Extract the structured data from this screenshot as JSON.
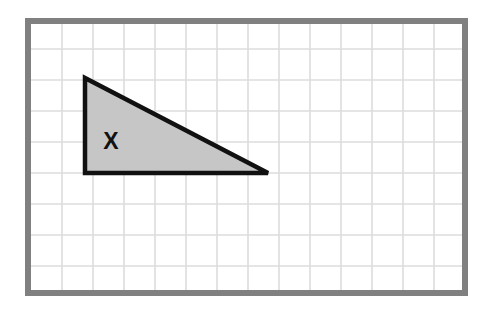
{
  "figure": {
    "kind": "geometry-diagram",
    "canvas": {
      "width": 494,
      "height": 318,
      "background_color": "#ffffff"
    },
    "frame": {
      "name": "grid-frame",
      "x": 25,
      "y": 18,
      "width": 443,
      "height": 278,
      "border_color": "#808080",
      "border_width": 6,
      "fill_color": "#ffffff"
    },
    "grid": {
      "name": "square-grid",
      "line_color": "#dcdcdc",
      "line_width": 1.6,
      "cell_size": 31,
      "origin_x": 31,
      "origin_y": 24,
      "columns": 14,
      "rows": 9,
      "vertical_lines": [
        62,
        93,
        124,
        155,
        186,
        217,
        248,
        279,
        310,
        341,
        372,
        403,
        434
      ],
      "horizontal_lines": [
        49,
        80,
        111,
        142,
        173,
        204,
        235,
        266
      ]
    },
    "shapes": [
      {
        "name": "shaded-right-triangle",
        "type": "triangle",
        "points": [
          {
            "label": "apex",
            "x": 85,
            "y": 78
          },
          {
            "label": "right-angle",
            "x": 85,
            "y": 173
          },
          {
            "label": "base-right",
            "x": 268,
            "y": 173
          }
        ],
        "fill_color": "#c6c6c6",
        "stroke_color": "#111111",
        "stroke_width": 4.5,
        "base_cells": 6,
        "height_cells": 3
      }
    ],
    "labels": [
      {
        "name": "triangle-label-x",
        "text": "X",
        "x": 111,
        "y": 141,
        "font_size": 23,
        "font_weight": "bold",
        "color": "#111111"
      }
    ]
  }
}
